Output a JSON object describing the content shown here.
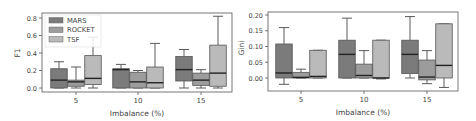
{
  "chart_data": [
    {
      "type": "box",
      "title": "",
      "xlabel": "Imbalance (%)",
      "ylabel": "F1",
      "categories": [
        "5",
        "10",
        "15"
      ],
      "yticks": [
        "0.0",
        "0.2",
        "0.4",
        "0.6",
        "0.8"
      ],
      "ylim": [
        -0.02,
        0.85
      ],
      "legend": {
        "position": "upper left",
        "entries": [
          "MARS",
          "ROCKET",
          "TSF"
        ]
      },
      "grid": false,
      "series": [
        {
          "name": "MARS",
          "color": "#7b7b7b",
          "boxes": [
            {
              "whislo": 0.0,
              "q1": 0.0,
              "med": 0.09,
              "q3": 0.22,
              "whishi": 0.3
            },
            {
              "whislo": 0.0,
              "q1": 0.0,
              "med": 0.21,
              "q3": 0.22,
              "whishi": 0.27
            },
            {
              "whislo": 0.0,
              "q1": 0.08,
              "med": 0.21,
              "q3": 0.36,
              "whishi": 0.44
            }
          ]
        },
        {
          "name": "ROCKET",
          "color": "#9c9c9c",
          "boxes": [
            {
              "whislo": 0.0,
              "q1": 0.02,
              "med": 0.07,
              "q3": 0.09,
              "whishi": 0.24
            },
            {
              "whislo": 0.0,
              "q1": 0.0,
              "med": 0.07,
              "q3": 0.18,
              "whishi": 0.2
            },
            {
              "whislo": 0.0,
              "q1": 0.03,
              "med": 0.09,
              "q3": 0.17,
              "whishi": 0.21
            }
          ]
        },
        {
          "name": "TSF",
          "color": "#bababa",
          "boxes": [
            {
              "whislo": 0.0,
              "q1": 0.04,
              "med": 0.11,
              "q3": 0.37,
              "whishi": 0.58
            },
            {
              "whislo": 0.0,
              "q1": 0.0,
              "med": 0.06,
              "q3": 0.24,
              "whishi": 0.51
            },
            {
              "whislo": 0.0,
              "q1": 0.02,
              "med": 0.17,
              "q3": 0.49,
              "whishi": 0.82
            }
          ]
        }
      ]
    },
    {
      "type": "box",
      "title": "",
      "xlabel": "Imbalance (%)",
      "ylabel": "Gini",
      "categories": [
        "5",
        "10",
        "15"
      ],
      "yticks": [
        "0.00",
        "0.05",
        "0.10",
        "0.15",
        "0.20"
      ],
      "ylim": [
        -0.04,
        0.205
      ],
      "legend": null,
      "grid": false,
      "series": [
        {
          "name": "MARS",
          "color": "#7b7b7b",
          "boxes": [
            {
              "whislo": -0.02,
              "q1": 0.0,
              "med": 0.016,
              "q3": 0.108,
              "whishi": 0.16
            },
            {
              "whislo": 0.0,
              "q1": 0.0,
              "med": 0.075,
              "q3": 0.12,
              "whishi": 0.19
            },
            {
              "whislo": 0.0,
              "q1": 0.014,
              "med": 0.075,
              "q3": 0.12,
              "whishi": 0.195
            }
          ]
        },
        {
          "name": "ROCKET",
          "color": "#9c9c9c",
          "boxes": [
            {
              "whislo": 0.0,
              "q1": 0.0,
              "med": 0.002,
              "q3": 0.018,
              "whishi": 0.028
            },
            {
              "whislo": 0.0,
              "q1": 0.0,
              "med": 0.008,
              "q3": 0.044,
              "whishi": 0.087
            },
            {
              "whislo": -0.018,
              "q1": -0.006,
              "med": 0.003,
              "q3": 0.057,
              "whishi": 0.087
            }
          ]
        },
        {
          "name": "TSF",
          "color": "#bababa",
          "boxes": [
            {
              "whislo": 0.0,
              "q1": 0.0,
              "med": 0.005,
              "q3": 0.088,
              "whishi": 0.088
            },
            {
              "whislo": -0.003,
              "q1": 0.0,
              "med": 0.0,
              "q3": 0.12,
              "whishi": 0.12
            },
            {
              "whislo": -0.03,
              "q1": 0.0,
              "med": 0.04,
              "q3": 0.172,
              "whishi": 0.172
            }
          ]
        }
      ]
    }
  ]
}
